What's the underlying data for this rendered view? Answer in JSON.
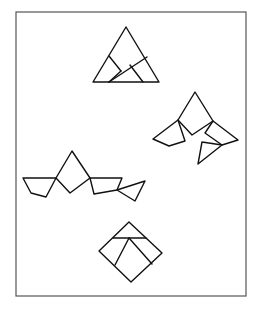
{
  "diagram": {
    "frame": {
      "x": 16,
      "y": 12,
      "width": 230,
      "height": 284,
      "stroke": "#555555"
    },
    "stroke_color": "#111111",
    "figures": [
      {
        "id": "triangle-assembled",
        "label": "",
        "polylines": [
          [
            [
              126,
              27
            ],
            [
              93,
              82
            ],
            [
              159,
              82
            ],
            [
              126,
              27
            ]
          ],
          [
            [
              109,
              56
            ],
            [
              121,
              71
            ]
          ],
          [
            [
              121,
              71
            ],
            [
              109,
              82
            ]
          ],
          [
            [
              109,
              82
            ],
            [
              147,
              57
            ]
          ],
          [
            [
              130,
              65
            ],
            [
              143,
              82
            ]
          ]
        ]
      },
      {
        "id": "pieces-scattered-right",
        "label": "",
        "polylines": [
          [
            [
              178,
              120
            ],
            [
              195,
              92
            ],
            [
              213,
              121
            ],
            [
              192,
              135
            ],
            [
              178,
              120
            ]
          ],
          [
            [
              178,
              120
            ],
            [
              153,
              139
            ],
            [
              169,
              146
            ],
            [
              185,
              141
            ],
            [
              178,
              120
            ]
          ],
          [
            [
              213,
              121
            ],
            [
              238,
              140
            ],
            [
              222,
              145
            ],
            [
              205,
              133
            ],
            [
              213,
              121
            ]
          ],
          [
            [
              202,
              142
            ],
            [
              222,
              145
            ],
            [
              198,
              164
            ],
            [
              202,
              142
            ]
          ]
        ]
      },
      {
        "id": "pieces-row-left",
        "label": "",
        "polylines": [
          [
            [
              56,
              178
            ],
            [
              72,
              151
            ],
            [
              90,
              178
            ],
            [
              70,
              193
            ],
            [
              56,
              178
            ]
          ],
          [
            [
              23,
              178
            ],
            [
              56,
              178
            ],
            [
              46,
              197
            ],
            [
              31,
              193
            ],
            [
              23,
              178
            ]
          ],
          [
            [
              90,
              178
            ],
            [
              122,
              178
            ],
            [
              117,
              190
            ],
            [
              94,
              194
            ],
            [
              90,
              178
            ]
          ],
          [
            [
              117,
              190
            ],
            [
              145,
              181
            ],
            [
              135,
              201
            ],
            [
              117,
              190
            ]
          ]
        ]
      },
      {
        "id": "diamond-assembled",
        "label": "",
        "polylines": [
          [
            [
              129,
              222
            ],
            [
              162,
              253
            ],
            [
              131,
              282
            ],
            [
              99,
              251
            ],
            [
              129,
              222
            ]
          ],
          [
            [
              113,
              238
            ],
            [
              146,
              238
            ]
          ],
          [
            [
              129,
              238
            ],
            [
              115,
              265
            ]
          ],
          [
            [
              129,
              238
            ],
            [
              152,
              264
            ]
          ]
        ]
      }
    ]
  }
}
